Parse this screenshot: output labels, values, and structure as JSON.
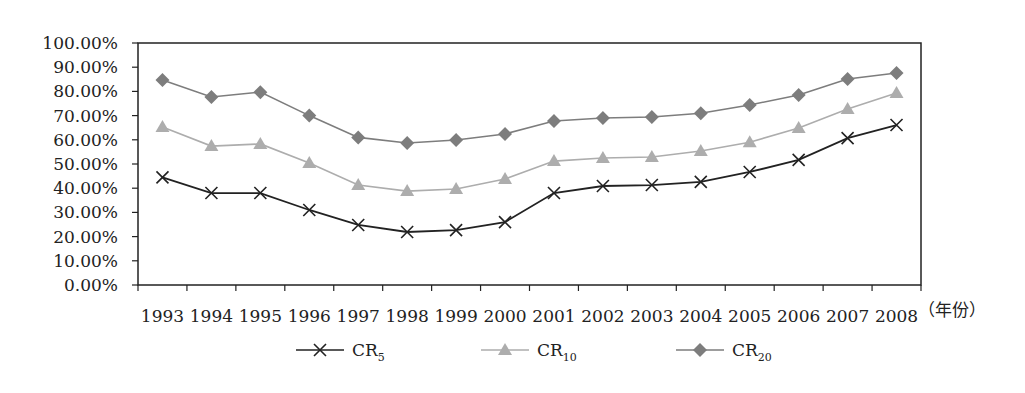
{
  "chart_data": {
    "type": "line",
    "title": "",
    "xlabel": "（年份）",
    "ylabel": "",
    "ylim": [
      0,
      100
    ],
    "yticks": [
      "0.00%",
      "10.00%",
      "20.00%",
      "30.00%",
      "40.00%",
      "50.00%",
      "60.00%",
      "70.00%",
      "80.00%",
      "90.00%",
      "100.00%"
    ],
    "grid": false,
    "legend_position": "bottom",
    "categories": [
      "1993",
      "1994",
      "1995",
      "1996",
      "1997",
      "1998",
      "1999",
      "2000",
      "2001",
      "2002",
      "2003",
      "2004",
      "2005",
      "2006",
      "2007",
      "2008"
    ],
    "series": [
      {
        "name": "CR5",
        "label_main": "CR",
        "label_sub": "5",
        "marker": "x",
        "color": "#222222",
        "values": [
          44.5,
          38.0,
          38.0,
          31.0,
          24.8,
          21.9,
          22.7,
          26.0,
          38.0,
          40.9,
          41.3,
          42.6,
          46.7,
          51.7,
          60.7,
          66.1
        ]
      },
      {
        "name": "CR10",
        "label_main": "CR",
        "label_sub": "10",
        "marker": "triangle",
        "color": "#adadad",
        "values": [
          65.3,
          57.4,
          58.3,
          50.4,
          41.3,
          38.8,
          39.7,
          43.8,
          51.2,
          52.5,
          52.9,
          55.4,
          59.0,
          64.9,
          72.7,
          79.3
        ]
      },
      {
        "name": "CR20",
        "label_main": "CR",
        "label_sub": "20",
        "marker": "diamond",
        "color": "#7d7d7d",
        "values": [
          84.7,
          77.7,
          79.7,
          70.0,
          61.0,
          58.7,
          59.9,
          62.4,
          67.8,
          69.0,
          69.4,
          71.0,
          74.4,
          78.5,
          85.1,
          87.6
        ]
      }
    ]
  }
}
